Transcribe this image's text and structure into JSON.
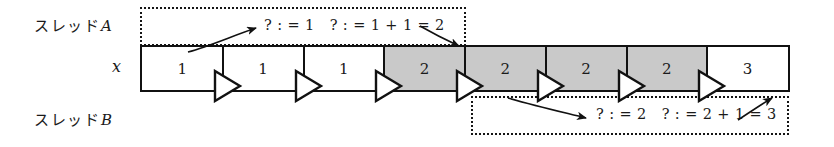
{
  "diagram": {
    "variable_label": "x",
    "threads": [
      {
        "id": "A",
        "label_jp": "スレッド",
        "label_latin": "A",
        "annotation": "? : = 1   ? : = 1 + 1 = 2"
      },
      {
        "id": "B",
        "label_jp": "スレッド",
        "label_latin": "B",
        "annotation": "? : = 2   ? : = 2 + 1 = 3"
      }
    ],
    "timeline": {
      "cells": [
        {
          "value": "1",
          "shaded": false
        },
        {
          "value": "1",
          "shaded": false
        },
        {
          "value": "1",
          "shaded": false
        },
        {
          "value": "2",
          "shaded": true
        },
        {
          "value": "2",
          "shaded": true
        },
        {
          "value": "2",
          "shaded": true
        },
        {
          "value": "2",
          "shaded": true
        },
        {
          "value": "3",
          "shaded": false
        }
      ],
      "marker_icon": "play-triangle-icon"
    },
    "colors": {
      "shaded_cell": "#c9c9c9",
      "unshaded_cell": "#ffffff",
      "stroke": "#111111",
      "text": "#1a1a1a"
    }
  }
}
